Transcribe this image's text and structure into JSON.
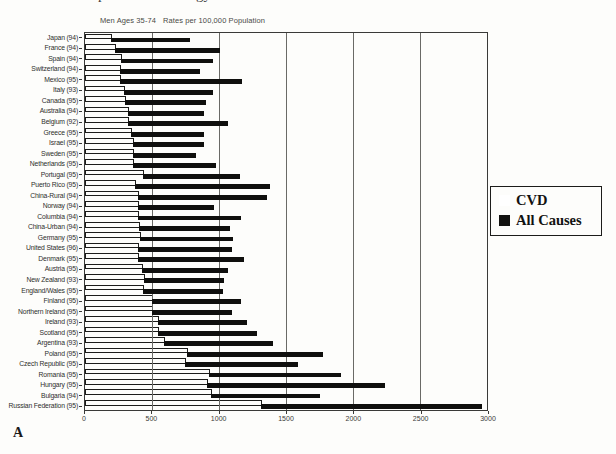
{
  "page": {
    "panel_label": "A",
    "clipped_fragments": [
      "p",
      "gy"
    ],
    "subtitle_left": "Men Ages 35-74",
    "subtitle_right": "Rates per 100,000 Population"
  },
  "legend": {
    "items": [
      {
        "label": "CVD",
        "swatch": "white-square-outline",
        "color": "#ffffff"
      },
      {
        "label": "All Causes",
        "swatch": "black-square",
        "color": "#121210"
      }
    ]
  },
  "colors": {
    "bar_black": "#0f0f0d",
    "bar_white": "#fdfdfb",
    "paper": "#fdfdfb",
    "line": "#3a3a38"
  },
  "chart_data": {
    "type": "bar",
    "orientation": "horizontal",
    "title": "",
    "subtitle": "Men Ages 35-74   Rates per 100,000 Population",
    "xlabel": "",
    "ylabel": "",
    "xlim": [
      0,
      3000
    ],
    "x_ticks": [
      0,
      500,
      1000,
      1500,
      2000,
      2500,
      3000
    ],
    "gridlines": [
      500,
      1000,
      1500,
      2000,
      2500
    ],
    "grid": "vertical",
    "legend_position": "right",
    "categories": [
      "Japan (94)",
      "France (94)",
      "Spain (94)",
      "Switzerland (94)",
      "Mexico (95)",
      "Italy (93)",
      "Canada (95)",
      "Australia (94)",
      "Belgium (92)",
      "Greece (95)",
      "Israel (95)",
      "Sweden (95)",
      "Netherlands (95)",
      "Portugal (95)",
      "Puerto Rico (95)",
      "China-Rural (94)",
      "Norway (94)",
      "Columbia (94)",
      "China-Urban (94)",
      "Germany (95)",
      "United States (96)",
      "Denmark (95)",
      "Austria (95)",
      "New Zealand (93)",
      "England/Wales (95)",
      "Finland (95)",
      "Northern Ireland (95)",
      "Ireland (93)",
      "Scotland (95)",
      "Argentina (93)",
      "Poland (95)",
      "Czech Republic (95)",
      "Romania (95)",
      "Hungary (95)",
      "Bulgaria (94)",
      "Russian Federation (95)"
    ],
    "series": [
      {
        "name": "CVD",
        "values": [
          200,
          230,
          275,
          265,
          265,
          295,
          305,
          325,
          325,
          350,
          365,
          365,
          365,
          440,
          380,
          400,
          400,
          400,
          410,
          415,
          400,
          400,
          430,
          445,
          440,
          505,
          510,
          555,
          555,
          595,
          770,
          750,
          930,
          915,
          950,
          1320
        ]
      },
      {
        "name": "All Causes",
        "values": [
          785,
          1005,
          955,
          855,
          1170,
          955,
          900,
          890,
          1070,
          885,
          890,
          830,
          975,
          1160,
          1380,
          1360,
          965,
          1165,
          1085,
          1105,
          1100,
          1190,
          1070,
          1040,
          1030,
          1165,
          1100,
          1210,
          1285,
          1405,
          1775,
          1590,
          1910,
          2240,
          1755,
          2960
        ]
      }
    ]
  }
}
